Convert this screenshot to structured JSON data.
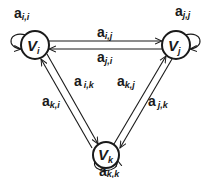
{
  "diagram": {
    "type": "directed-graph",
    "colors": {
      "stroke": "#1a1a1a",
      "background": "#ffffff",
      "node_fill": "#ffffff"
    },
    "nodes": [
      {
        "id": "i",
        "label": "V",
        "sub": "i",
        "cx": 35,
        "cy": 45,
        "r": 14
      },
      {
        "id": "j",
        "label": "V",
        "sub": "j",
        "cx": 176,
        "cy": 45,
        "r": 14
      },
      {
        "id": "k",
        "label": "V",
        "sub": "k",
        "cx": 106,
        "cy": 155,
        "r": 13
      }
    ],
    "edges": [
      {
        "from": "i",
        "to": "i",
        "label": "a",
        "sub": "i,i"
      },
      {
        "from": "j",
        "to": "j",
        "label": "a",
        "sub": "j,j"
      },
      {
        "from": "k",
        "to": "k",
        "label": "a",
        "sub": "k,k"
      },
      {
        "from": "i",
        "to": "j",
        "label": "a",
        "sub": "i,j"
      },
      {
        "from": "j",
        "to": "i",
        "label": "a",
        "sub": "j,i"
      },
      {
        "from": "i",
        "to": "k",
        "label": "a",
        "sub": "i,k"
      },
      {
        "from": "k",
        "to": "i",
        "label": "a",
        "sub": "k,i"
      },
      {
        "from": "k",
        "to": "j",
        "label": "a",
        "sub": "k,j"
      },
      {
        "from": "j",
        "to": "k",
        "label": "a",
        "sub": "j,k"
      }
    ]
  },
  "labels": {
    "vi": {
      "main": "V",
      "sub": "i"
    },
    "vj": {
      "main": "V",
      "sub": "j"
    },
    "vk": {
      "main": "V",
      "sub": "k"
    },
    "aii": {
      "main": "a",
      "sub": "i,i"
    },
    "ajj": {
      "main": "a",
      "sub": "j,j"
    },
    "akk": {
      "main": "a",
      "sub": "k,k"
    },
    "aij": {
      "main": "a",
      "sub": "i,j"
    },
    "aji": {
      "main": "a",
      "sub": "j,i"
    },
    "aik": {
      "main": "a",
      "sub": "i,k"
    },
    "aki": {
      "main": "a",
      "sub": "k,i"
    },
    "akj": {
      "main": "a",
      "sub": "k,j"
    },
    "ajk": {
      "main": "a",
      "sub": "j,k"
    }
  }
}
